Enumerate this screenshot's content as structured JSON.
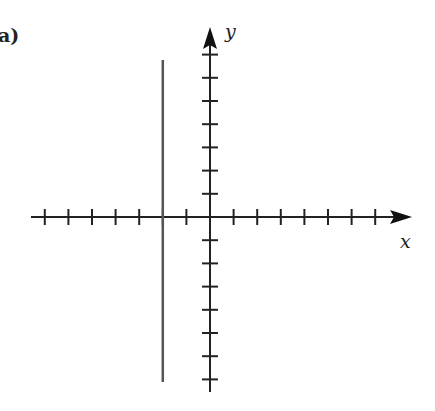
{
  "figure": {
    "panel_label": "a)"
  },
  "chart_data": {
    "type": "line",
    "title": "",
    "panel_label": "a)",
    "xlabel": "x",
    "ylabel": "y",
    "xlim": [
      -7.5,
      8
    ],
    "ylim": [
      -7.2,
      7.5
    ],
    "grid": false,
    "x_ticks": [
      -7,
      -6,
      -5,
      -4,
      -3,
      -2,
      -1,
      1,
      2,
      3,
      4,
      5,
      6,
      7
    ],
    "y_ticks": [
      -7,
      -6,
      -5,
      -4,
      -3,
      -2,
      -1,
      1,
      2,
      3,
      4,
      5,
      6,
      7
    ],
    "tick_labels_shown": false,
    "series": [
      {
        "name": "vertical line",
        "equation": "x = -2",
        "x": [
          -2,
          -2
        ],
        "y": [
          -7,
          6.8
        ],
        "color": "#555555"
      }
    ]
  },
  "colors": {
    "axis": "#222222",
    "line": "#555555"
  }
}
